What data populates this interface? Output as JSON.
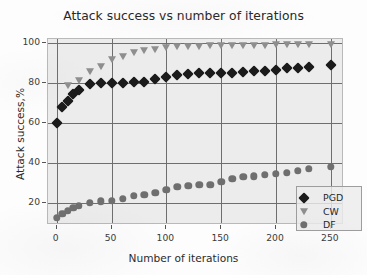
{
  "chart_data": {
    "type": "scatter",
    "title": "Attack success vs number of iterations",
    "xlabel": "Number of iterations",
    "ylabel": "Attack success,%",
    "xlim": [
      -8,
      262
    ],
    "ylim": [
      9,
      102
    ],
    "xticks": [
      0,
      50,
      100,
      150,
      200,
      250
    ],
    "yticks": [
      20,
      40,
      60,
      80,
      100
    ],
    "xtick_labels": [
      "0",
      "50",
      "100",
      "150",
      "200",
      "250"
    ],
    "ytick_labels": [
      "20",
      "40",
      "60",
      "80",
      "100"
    ],
    "grid": true,
    "legend_position": "lower right",
    "plot_bgcolor": "#ececec",
    "series": [
      {
        "name": "PGD",
        "marker": "diamond",
        "color": "#1b1b1b",
        "x": [
          0,
          5,
          10,
          15,
          20,
          30,
          40,
          50,
          60,
          70,
          80,
          90,
          100,
          110,
          120,
          130,
          140,
          150,
          160,
          170,
          180,
          190,
          200,
          210,
          220,
          230,
          250
        ],
        "y": [
          60.0,
          68.0,
          71.0,
          74.5,
          76.5,
          79.5,
          79.8,
          80.0,
          80.0,
          80.3,
          80.5,
          82.0,
          83.0,
          84.0,
          84.5,
          84.8,
          85.0,
          85.0,
          84.8,
          85.5,
          86.0,
          86.0,
          86.5,
          87.5,
          87.5,
          88.0,
          89.0
        ]
      },
      {
        "name": "CW",
        "marker": "triangle-down",
        "color": "#8e8e8e",
        "x": [
          10,
          20,
          30,
          40,
          50,
          60,
          70,
          80,
          90,
          100,
          110,
          120,
          130,
          140,
          150,
          160,
          170,
          180,
          190,
          200,
          210,
          220,
          230,
          250
        ],
        "y": [
          79.0,
          81.5,
          86.0,
          88.5,
          92.0,
          93.5,
          95.5,
          96.5,
          97.0,
          98.0,
          98.3,
          98.5,
          98.5,
          98.8,
          98.8,
          99.0,
          99.0,
          99.0,
          99.2,
          99.3,
          99.3,
          99.4,
          99.4,
          99.5
        ]
      },
      {
        "name": "DF",
        "marker": "circle",
        "color": "#6f6f6f",
        "x": [
          0,
          5,
          10,
          15,
          20,
          30,
          40,
          50,
          60,
          70,
          80,
          90,
          100,
          110,
          120,
          130,
          140,
          150,
          160,
          170,
          180,
          190,
          200,
          210,
          220,
          230,
          250
        ],
        "y": [
          12.5,
          14.5,
          16.0,
          17.5,
          18.5,
          20.0,
          20.8,
          21.2,
          22.0,
          23.5,
          24.0,
          25.0,
          26.5,
          28.0,
          28.5,
          29.0,
          29.0,
          30.5,
          32.0,
          33.0,
          33.3,
          34.0,
          34.5,
          35.0,
          36.0,
          37.0,
          38.0
        ]
      }
    ]
  },
  "legend": {
    "items": [
      {
        "label": "PGD",
        "marker": "diamond-icon"
      },
      {
        "label": "CW",
        "marker": "triangle-down-icon"
      },
      {
        "label": "DF",
        "marker": "circle-icon"
      }
    ]
  }
}
